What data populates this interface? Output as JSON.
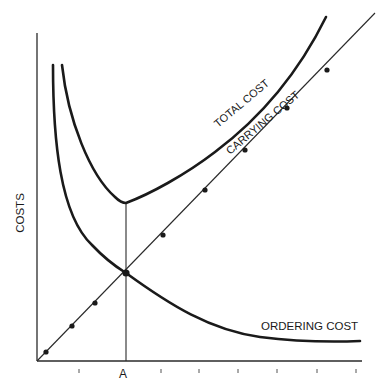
{
  "chart_data": {
    "type": "line",
    "title": "",
    "xlabel": "",
    "ylabel": "COSTS",
    "x_tick_labels": [
      {
        "position": "A",
        "label": "A"
      }
    ],
    "grid": false,
    "legend": "none (inline curve labels)",
    "series": [
      {
        "name": "TOTAL COST",
        "shape": "U-shaped curve, minimum at x = A",
        "style": "thick"
      },
      {
        "name": "CARRYING COST",
        "shape": "straight line from origin, increasing, with marker dots",
        "style": "thin with dots"
      },
      {
        "name": "ORDERING COST",
        "shape": "decreasing hyperbola",
        "style": "thick"
      }
    ],
    "annotations": [
      {
        "type": "vertical-line",
        "at": "A",
        "note": "economic order quantity where ordering cost = carrying cost and total cost is minimum"
      }
    ]
  },
  "labels": {
    "y_axis": "COSTS",
    "x_marker": "A",
    "total_cost": "TOTAL COST",
    "carrying_cost": "CARRYING COST",
    "ordering_cost": "ORDERING COST"
  },
  "geometry": {
    "origin": [
      37,
      361
    ],
    "y_axis_top": 33,
    "x_axis_right": 362,
    "a_x": 126,
    "x_ticks": [
      79,
      161,
      199,
      238,
      277,
      317,
      356
    ],
    "carrying_dots": [
      [
        46,
        352
      ],
      [
        72,
        326
      ],
      [
        95,
        303
      ],
      [
        126,
        273
      ],
      [
        163,
        235
      ],
      [
        205,
        190
      ],
      [
        245,
        150
      ],
      [
        287,
        108
      ],
      [
        327,
        70
      ]
    ],
    "carrying_line_end": [
      375,
      13
    ],
    "intersection": [
      126,
      273
    ],
    "total_min": [
      126,
      203
    ]
  },
  "colors": {
    "ink": "#1a1a1a",
    "background": "#ffffff"
  }
}
